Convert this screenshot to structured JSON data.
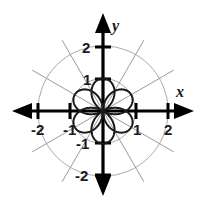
{
  "figure": {
    "kind": "polar-rose-graph",
    "background_color": "#ffffff",
    "curve_color": "#1a1a1a",
    "axis_color": "#000000",
    "grid_color": "#aaaaaa",
    "axis_labels": {
      "x": "x",
      "y": "y"
    },
    "x_ticks": [
      {
        "value": -2,
        "label": "-2",
        "px": 38
      },
      {
        "value": -1,
        "label": "-1",
        "px": 70
      },
      {
        "value": 1,
        "label": "1",
        "px": 136
      },
      {
        "value": 2,
        "label": "2",
        "px": 168
      }
    ],
    "y_ticks": [
      {
        "value": 2,
        "label": "2",
        "px": 47
      },
      {
        "value": 1,
        "label": "1",
        "px": 79
      },
      {
        "value": -1,
        "label": "-1",
        "px": 143
      },
      {
        "value": -2,
        "label": "-2",
        "px": 175
      }
    ]
  },
  "chart_data": {
    "type": "line",
    "subtype": "polar-rose",
    "title": "",
    "xlabel": "x",
    "ylabel": "y",
    "xlim": [
      -2.6,
      2.6
    ],
    "ylim": [
      -2.6,
      2.6
    ],
    "grid": true,
    "grid_circles_r": [
      1,
      2
    ],
    "grid_radial_lines_deg": [
      0,
      30,
      60,
      90,
      120,
      150
    ],
    "legend": "none",
    "origin_px": [
      103,
      111
    ],
    "unit_px": 32.6,
    "series": [
      {
        "name": "r = cos(3θ/2) rose",
        "equation": "r = cos(3θ/2)",
        "petal_count": 3,
        "max_radius": 1,
        "petal_axis_angles_deg": [
          45,
          135,
          270
        ],
        "theta_range_deg": [
          0,
          720
        ],
        "theta_step_deg": 1.5
      }
    ]
  }
}
